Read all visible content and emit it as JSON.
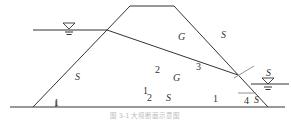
{
  "diagram": {
    "type": "dam cross-section with phreatic line and failure surfaces",
    "zone_labels": {
      "upstream_shell": "S",
      "core_upper": "G",
      "downstream_upper": "S",
      "core_lower": "G",
      "lower_middle": "S",
      "toe_right": "S",
      "tailwater": "S"
    },
    "numbers": {
      "n1_left": "1",
      "n2_mid": "2",
      "n3": "3",
      "n1_sub": "1",
      "n2_sub": "2",
      "n1_right": "1",
      "n4": "4"
    },
    "water_symbols": [
      "upstream-water-level",
      "downstream-water-level"
    ],
    "caption": "图 3-1  大坝断面示意图"
  }
}
